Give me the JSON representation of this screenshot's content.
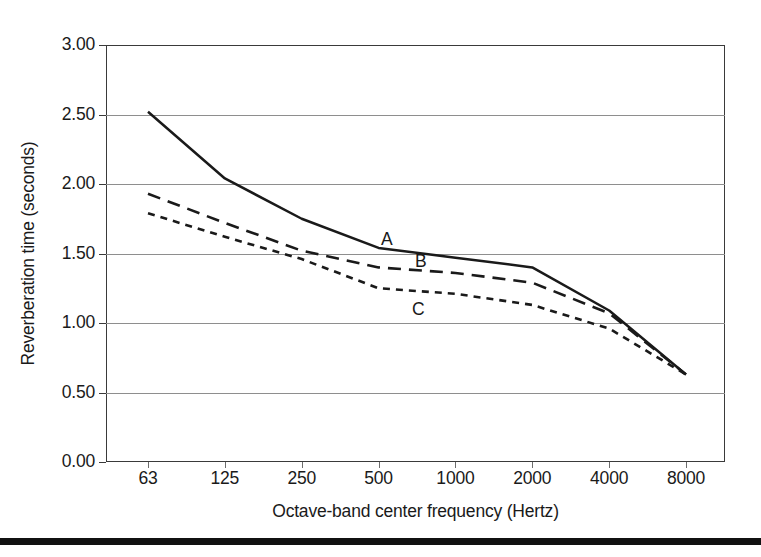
{
  "chart_data": {
    "type": "line",
    "title": "",
    "subtitle": "",
    "xlabel": "Octave-band center frequency (Hertz)",
    "ylabel": "Reverberation time (seconds)",
    "x": [
      63,
      125,
      250,
      500,
      1000,
      2000,
      4000,
      8000
    ],
    "xtick_labels": [
      "63",
      "125",
      "250",
      "500",
      "1000",
      "2000",
      "4000",
      "8000"
    ],
    "xscale": "log2-octave-bands",
    "ytick_labels": [
      "0.00",
      "0.50",
      "1.00",
      "1.50",
      "2.00",
      "2.50",
      "3.00"
    ],
    "ytick_values": [
      0.0,
      0.5,
      1.0,
      1.5,
      2.0,
      2.5,
      3.0
    ],
    "ylim": [
      0.0,
      3.0
    ],
    "grid": "horizontal",
    "legend_position": "inline-annotations",
    "series": [
      {
        "name": "A",
        "style": "solid",
        "color": "#1a1a1a",
        "values": [
          2.52,
          2.04,
          1.75,
          1.54,
          1.47,
          1.4,
          1.09,
          0.63
        ]
      },
      {
        "name": "B",
        "style": "long-dash",
        "color": "#1a1a1a",
        "values": [
          1.93,
          1.72,
          1.52,
          1.4,
          1.36,
          1.29,
          1.07,
          0.63
        ]
      },
      {
        "name": "C",
        "style": "short-dash",
        "color": "#1a1a1a",
        "values": [
          1.79,
          1.62,
          1.46,
          1.25,
          1.21,
          1.13,
          0.96,
          0.63
        ]
      }
    ],
    "annotations": [
      {
        "text": "A",
        "x": 700,
        "y": 1.6
      },
      {
        "text": "B",
        "x": 770,
        "y": 1.44
      },
      {
        "text": "C",
        "x": 560,
        "y": 1.09
      }
    ]
  },
  "figure": {
    "frame_color": "#3a3a3a",
    "grid_color": "#8e8e8e",
    "ink_color": "#1a1a1a",
    "rule_color": "#111111",
    "background": "#ffffff"
  },
  "yticks": [
    {
      "label": "3.00",
      "value": 3.0
    },
    {
      "label": "2.50",
      "value": 2.5
    },
    {
      "label": "2.00",
      "value": 2.0
    },
    {
      "label": "1.50",
      "value": 1.5
    },
    {
      "label": "1.00",
      "value": 1.0
    },
    {
      "label": "0.50",
      "value": 0.5
    },
    {
      "label": "0.00",
      "value": 0.0
    }
  ],
  "xticks": [
    {
      "label": "63"
    },
    {
      "label": "125"
    },
    {
      "label": "250"
    },
    {
      "label": "500"
    },
    {
      "label": "1000"
    },
    {
      "label": "2000"
    },
    {
      "label": "4000"
    },
    {
      "label": "8000"
    }
  ],
  "series_labels": [
    {
      "label": "A"
    },
    {
      "label": "B"
    },
    {
      "label": "C"
    }
  ]
}
